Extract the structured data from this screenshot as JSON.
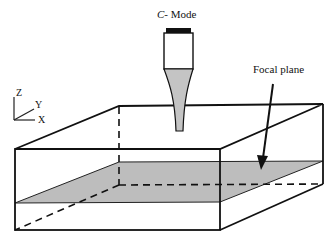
{
  "diagram": {
    "title_prefix": "C",
    "title_suffix": "- Mode",
    "focal_label": "Focal plane",
    "axes": {
      "z": "Z",
      "y": "Y",
      "x": "X"
    },
    "colors": {
      "line": "#111111",
      "plane_fill": "#bdbdbd",
      "cone_fill": "#c4c4c4",
      "cap": "#111111"
    }
  }
}
